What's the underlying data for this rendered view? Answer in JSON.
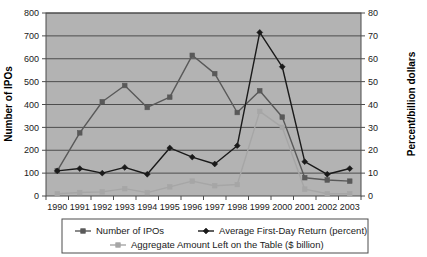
{
  "chart_data": {
    "type": "line",
    "title": "",
    "xlabel": "",
    "ylabel": "Number of IPOs",
    "y2label": "Percent/billion dollars",
    "categories": [
      "1990",
      "1991",
      "1992",
      "1993",
      "1994",
      "1995",
      "1996",
      "1997",
      "1998",
      "1999",
      "2000",
      "2001",
      "2002",
      "2003"
    ],
    "ylim": [
      0,
      800
    ],
    "y2lim": [
      0,
      80
    ],
    "yticks": [
      0,
      100,
      200,
      300,
      400,
      500,
      600,
      700,
      800
    ],
    "y2ticks": [
      0,
      10,
      20,
      30,
      40,
      50,
      60,
      70,
      80
    ],
    "grid": true,
    "legend_position": "bottom",
    "series": [
      {
        "name": "Number of IPOs",
        "axis": "left",
        "color": "#595959",
        "marker": "square",
        "values": [
          110,
          276,
          412,
          483,
          387,
          432,
          615,
          535,
          365,
          460,
          345,
          80,
          70,
          65
        ]
      },
      {
        "name": "Average First-Day Return (percent)",
        "axis": "right",
        "color": "#1a1a1a",
        "marker": "diamond",
        "values": [
          11,
          12,
          10,
          12.5,
          9.5,
          21,
          17,
          14,
          22,
          71.5,
          56.5,
          15,
          9.5,
          12
        ]
      },
      {
        "name": "Aggregate Amount Left on the Table ($ billion)",
        "axis": "right",
        "color": "#a6a6a6",
        "marker": "square",
        "values": [
          1,
          1.5,
          1.8,
          3.2,
          1.5,
          4,
          6.5,
          4.5,
          5,
          37,
          30,
          3,
          1,
          1
        ]
      }
    ]
  },
  "legend": {
    "items": [
      {
        "label": "Number of IPOs",
        "color": "#595959",
        "marker": "square"
      },
      {
        "label": "Average First-Day Return (percent)",
        "color": "#1a1a1a",
        "marker": "diamond"
      },
      {
        "label": "Aggregate Amount Left on the Table ($ billion)",
        "color": "#a6a6a6",
        "marker": "square"
      }
    ]
  },
  "colors": {
    "plot_background": "#b3b3b3",
    "page_background": "#ffffff",
    "gridline": "#4d4d4d",
    "axis": "#4d4d4d",
    "text": "#1a1a1a"
  }
}
